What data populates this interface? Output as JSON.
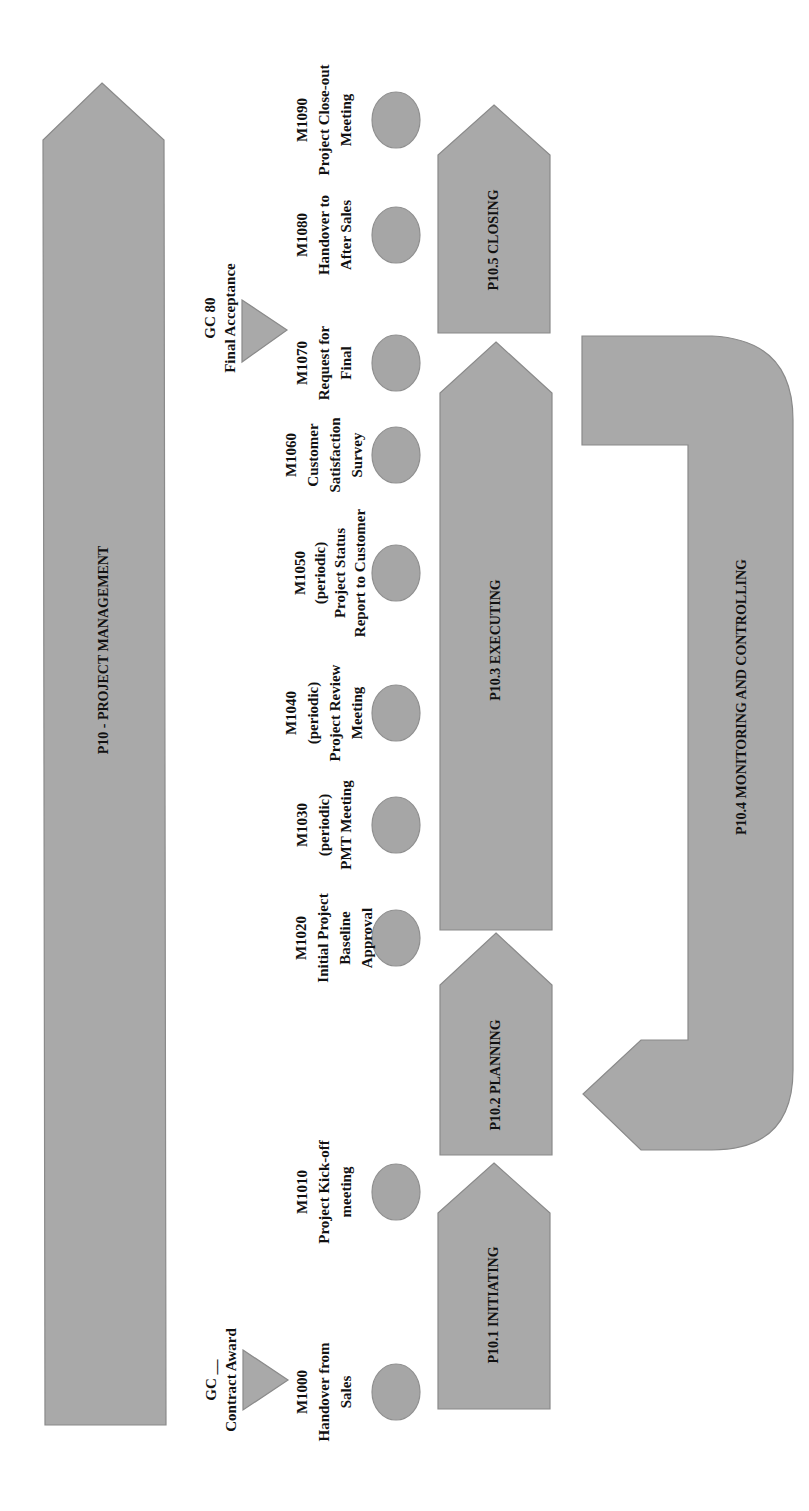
{
  "diagram": {
    "colors": {
      "shape_fill": "#a9a9a9",
      "shape_stroke": "#8a8a8a",
      "text": "#111111",
      "background": "#ffffff"
    },
    "main_process": {
      "label": "P10 - PROJECT MANAGEMENT",
      "cx": 104,
      "cy": 650
    },
    "phases": [
      {
        "id": "initiating",
        "label": "P10.1 INITIATING",
        "cx": 494,
        "cy": 1305
      },
      {
        "id": "planning",
        "label": "P10.2 PLANNING",
        "cx": 496,
        "cy": 1075
      },
      {
        "id": "executing",
        "label": "P10.3 EXECUTING",
        "cx": 496,
        "cy": 640
      },
      {
        "id": "monitoring",
        "label": "P10.4 MONITORING AND CONTROLLING",
        "cx": 742,
        "cy": 697
      },
      {
        "id": "closing",
        "label": "P10.5 CLOSING",
        "cx": 494,
        "cy": 240
      }
    ],
    "gates": [
      {
        "id": "gc-contract-award",
        "lines": [
          "GC __",
          "Contract Award"
        ],
        "cx": 221,
        "cy": 1380
      },
      {
        "id": "gc-80",
        "lines": [
          "GC 80",
          "Final Acceptance"
        ],
        "cx": 220,
        "cy": 318
      }
    ],
    "milestones": [
      {
        "id": "M1000",
        "lines": [
          "M1000",
          "Handover from",
          "Sales"
        ],
        "label_cx": 324,
        "ellipse_cy": 1392
      },
      {
        "id": "M1010",
        "lines": [
          "M1010",
          "Project Kick-off",
          "meeting"
        ],
        "label_cx": 324,
        "ellipse_cy": 1192
      },
      {
        "id": "M1020",
        "lines": [
          "M1020",
          "Initial Project",
          "Baseline",
          "Approval"
        ],
        "label_cx": 330,
        "ellipse_cy": 938
      },
      {
        "id": "M1030",
        "lines": [
          "M1030",
          "(periodic)",
          "PMT Meeting"
        ],
        "label_cx": 324,
        "ellipse_cy": 825
      },
      {
        "id": "M1040",
        "lines": [
          "M1040",
          "(periodic)",
          "Project Review",
          "Meeting"
        ],
        "label_cx": 330,
        "ellipse_cy": 713
      },
      {
        "id": "M1050",
        "lines": [
          "M1050",
          "(periodic)",
          "Project Status",
          "Report to Customer"
        ],
        "label_cx": 330,
        "ellipse_cy": 573
      },
      {
        "id": "M1060",
        "lines": [
          "M1060",
          "Customer",
          "Satisfaction",
          "Survey"
        ],
        "label_cx": 330,
        "ellipse_cy": 455
      },
      {
        "id": "M1070",
        "lines": [
          "M1070",
          "Request for",
          "Final"
        ],
        "label_cx": 324,
        "ellipse_cy": 363
      },
      {
        "id": "M1080",
        "lines": [
          "M1080",
          "Handover to",
          "After Sales"
        ],
        "label_cx": 324,
        "ellipse_cy": 235
      },
      {
        "id": "M1090",
        "lines": [
          "M1090",
          "Project Close-out",
          "Meeting"
        ],
        "label_cx": 324,
        "ellipse_cy": 120
      }
    ]
  }
}
